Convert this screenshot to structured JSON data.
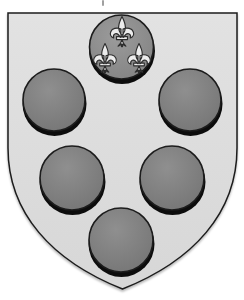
{
  "artwork": {
    "name": "coat-of-arms-six-roundels",
    "description": "Heater shield bearing six roundels: five dark balls (2-2-1) and one chief roundel charged with three fleurs-de-lis",
    "colors": {
      "background": "#ffffff",
      "shield_fill": "#e2e2e2",
      "shield_fill_edge": "#d7d7d7",
      "outline": "#1c1c1c",
      "ball_highlight": "#8f8f8f",
      "ball_fill": "#747474",
      "ball_shadow": "#0c0c0c",
      "chief_highlight": "#9b9b9b",
      "chief_fill": "#828282",
      "fleur_fill": "#ececec",
      "fleur_outline": "#2d2d2d",
      "stray_mark": "#a0a0a0"
    },
    "shield": {
      "top_y": 13,
      "left_x": 8,
      "right_x": 237,
      "side_end_y": 148,
      "point_x": 122.5,
      "point_y": 289
    },
    "chief_roundel": {
      "cx": 121.5,
      "cy": 48,
      "r": 32
    },
    "fleur_count": 3,
    "fleurs": [
      {
        "cx": 122,
        "top": 16,
        "h": 34
      },
      {
        "cx": 105,
        "top": 43,
        "h": 33
      },
      {
        "cx": 139,
        "top": 43,
        "h": 33
      }
    ],
    "ball_count": 5,
    "balls": [
      {
        "cx": 54,
        "cy": 101,
        "r": 31
      },
      {
        "cx": 190,
        "cy": 101,
        "r": 31
      },
      {
        "cx": 72,
        "cy": 179,
        "r": 32
      },
      {
        "cx": 172,
        "cy": 179,
        "r": 32
      },
      {
        "cx": 121,
        "cy": 241,
        "r": 32
      }
    ]
  }
}
